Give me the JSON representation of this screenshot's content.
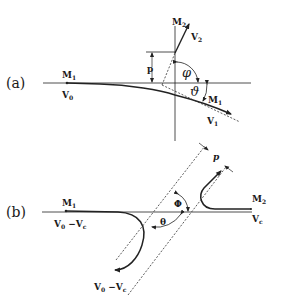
{
  "figure": {
    "panel_a": {
      "label": "(a)",
      "particle1": {
        "name": "M",
        "sub": "1"
      },
      "initial_velocity": {
        "name": "V",
        "sub": "0"
      },
      "particle2": {
        "name": "M",
        "sub": "2"
      },
      "velocity2": {
        "name": "V",
        "sub": "2"
      },
      "particle1_final": {
        "name": "M",
        "sub": "1"
      },
      "velocity1": {
        "name": "V",
        "sub": "1"
      },
      "impact_parameter": "p",
      "angle_recoil": "φ",
      "angle_scatter": "ϑ"
    },
    "panel_b": {
      "label": "(b)",
      "particle1": {
        "name": "M",
        "sub": "1"
      },
      "rel_velocity_in": {
        "name": "V",
        "sub0": "0",
        "minus": " −V",
        "subc": "c"
      },
      "rel_velocity_out": {
        "name": "V",
        "sub0": "0",
        "minus": " −V",
        "subc": "c"
      },
      "particle2": {
        "name": "M",
        "sub": "2"
      },
      "cm_velocity": {
        "name": "V",
        "sub": "c"
      },
      "impact_parameter": "p",
      "angle_phi": "Φ",
      "angle_theta": "θ"
    }
  }
}
